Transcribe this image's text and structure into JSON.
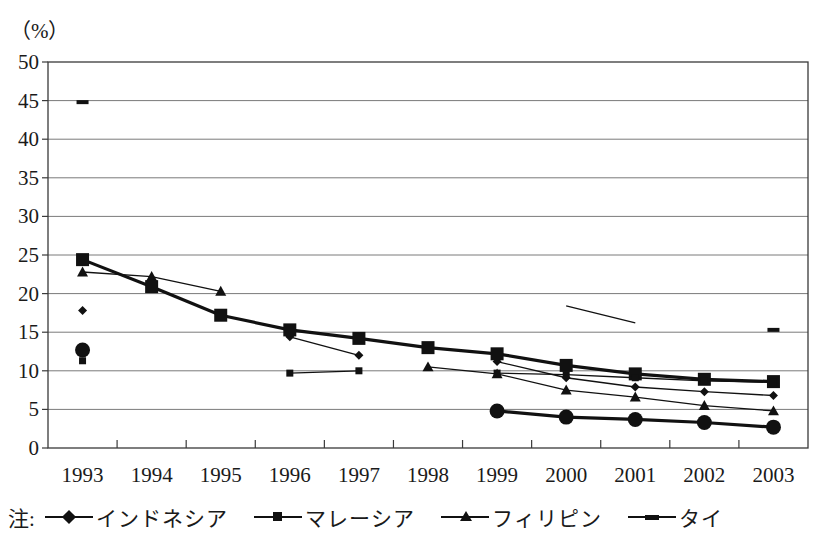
{
  "chart_data": {
    "type": "line",
    "title": "",
    "subtitle": "",
    "unit_label": "（%）",
    "xlabel": "",
    "ylabel": "",
    "ylim": [
      0,
      50
    ],
    "ytick_step": 5,
    "yticks": [
      "0",
      "5",
      "10",
      "15",
      "20",
      "25",
      "30",
      "35",
      "40",
      "45",
      "50"
    ],
    "grid": true,
    "legend_position": "bottom",
    "legend_prefix": "注:",
    "categories": [
      "1993",
      "1994",
      "1995",
      "1996",
      "1997",
      "1998",
      "1999",
      "2000",
      "2001",
      "2002",
      "2003"
    ],
    "series": [
      {
        "name": "インドネシア",
        "marker": "diamond",
        "size": "small",
        "line": "thin",
        "values": [
          17.8,
          null,
          null,
          14.4,
          12.0,
          null,
          11.2,
          9.1,
          7.9,
          7.3,
          6.8
        ]
      },
      {
        "name": "マレーシア",
        "marker": "square",
        "size": "large",
        "line": "thick",
        "values": [
          24.4,
          20.9,
          17.2,
          15.3,
          14.2,
          13.0,
          12.2,
          10.7,
          9.6,
          8.9,
          8.6
        ]
      },
      {
        "name": "フィリピン",
        "marker": "triangle",
        "size": "small",
        "line": "thin",
        "values": [
          22.8,
          22.2,
          20.3,
          null,
          null,
          10.5,
          9.6,
          7.5,
          6.6,
          5.5,
          4.8
        ]
      },
      {
        "name": "タイ",
        "marker": "dash",
        "size": "small",
        "line": "thin",
        "values": [
          44.8,
          null,
          null,
          null,
          null,
          null,
          null,
          18.4,
          16.2,
          null,
          15.3
        ]
      },
      {
        "name": "series-circle",
        "marker": "circle",
        "size": "large",
        "line": "thick",
        "values": [
          12.7,
          null,
          null,
          null,
          null,
          null,
          4.8,
          4.0,
          3.7,
          3.3,
          2.7
        ]
      },
      {
        "name": "series-small-square",
        "marker": "square",
        "size": "small",
        "line": "thin",
        "values": [
          11.3,
          null,
          null,
          9.7,
          10.0,
          null,
          9.7,
          9.5,
          9.1,
          8.7,
          8.5
        ]
      }
    ]
  },
  "legend": {
    "note_prefix": "注:",
    "items": [
      {
        "label": "インドネシア",
        "marker": "diamond"
      },
      {
        "label": "マレーシア",
        "marker": "square"
      },
      {
        "label": "フィリピン",
        "marker": "triangle"
      },
      {
        "label": "タイ",
        "marker": "dash"
      }
    ]
  }
}
